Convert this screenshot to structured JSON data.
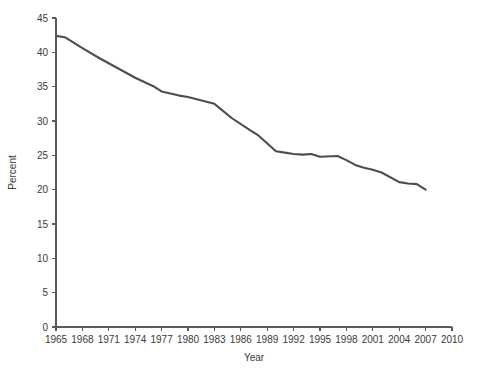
{
  "chart_data": {
    "type": "line",
    "title": "",
    "xlabel": "Year",
    "ylabel": "Percent",
    "xlim": [
      1965,
      2010
    ],
    "ylim": [
      0,
      45
    ],
    "grid": false,
    "legend": false,
    "line_color": "#4d4d4d",
    "axis_color": "#595959",
    "x_ticks": [
      1965,
      1968,
      1971,
      1974,
      1977,
      1980,
      1983,
      1986,
      1989,
      1992,
      1995,
      1998,
      2001,
      2004,
      2007,
      2010
    ],
    "y_ticks": [
      0,
      5,
      10,
      15,
      20,
      25,
      30,
      35,
      40,
      45
    ],
    "x_tick_labels": [
      "1965",
      "1968",
      "1971",
      "1974",
      "1977",
      "1980",
      "1983",
      "1986",
      "1989",
      "1992",
      "1995",
      "1998",
      "2001",
      "2004",
      "2007",
      "2010"
    ],
    "y_tick_labels": [
      "0",
      "5",
      "10",
      "15",
      "20",
      "25",
      "30",
      "35",
      "40",
      "45"
    ],
    "series": [
      {
        "name": "Percent",
        "x": [
          1965,
          1966,
          1968,
          1970,
          1974,
          1976,
          1977,
          1978,
          1979,
          1980,
          1983,
          1985,
          1987,
          1988,
          1990,
          1991,
          1992,
          1993,
          1994,
          1995,
          1997,
          1998,
          1999,
          2000,
          2001,
          2002,
          2004,
          2005,
          2006,
          2007
        ],
        "values": [
          42.4,
          42.2,
          40.6,
          39.1,
          36.3,
          35.1,
          34.3,
          34.0,
          33.7,
          33.5,
          32.5,
          30.4,
          28.7,
          27.9,
          25.6,
          25.4,
          25.2,
          25.1,
          25.2,
          24.8,
          24.9,
          24.3,
          23.6,
          23.2,
          22.9,
          22.5,
          21.1,
          20.9,
          20.8,
          20.0
        ]
      }
    ]
  },
  "labels": {
    "y_axis_title": "Percent",
    "x_axis_title": "Year"
  }
}
